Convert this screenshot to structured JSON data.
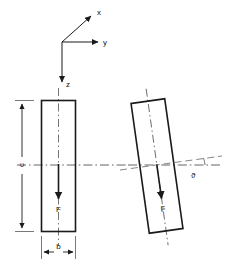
{
  "figure": {
    "background_color": "#ffffff",
    "line_color": "#1a1a1a",
    "centerline_color": "#555555"
  },
  "axes": {
    "origin_label": "",
    "x_label": "x",
    "y_label": "y",
    "z_label": "z",
    "x_icon": "axis-arrow-icon",
    "y_icon": "axis-arrow-icon",
    "z_icon": "axis-arrow-icon"
  },
  "upright_section": {
    "name": "upright-beam-section",
    "force_label": "F",
    "force_icon": "down-arrow-icon",
    "width_dimension_label": "b",
    "height_dimension_label": "c",
    "tilt_degrees": 0
  },
  "tilted_section": {
    "name": "tilted-beam-section",
    "force_label": "F",
    "force_icon": "down-arrow-icon",
    "angle_label": "ϑ",
    "tilt_degrees": 8
  },
  "dimensions": {
    "width_label": "b",
    "height_label": "c",
    "angle_label": "ϑ"
  }
}
